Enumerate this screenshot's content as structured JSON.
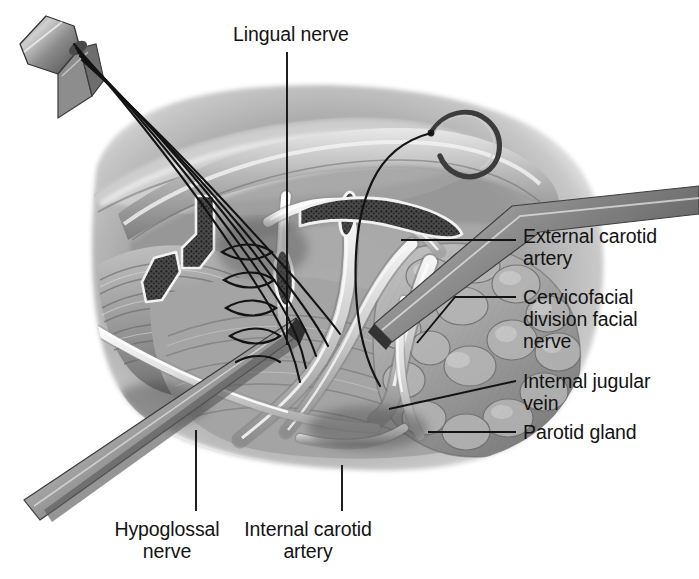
{
  "figure": {
    "kind": "medical-surgical-illustration",
    "style": "grayscale halftone line-and-wash anatomical drawing",
    "background_color": "#ffffff",
    "ink_color": "#131313",
    "tissue_mid_tone": "#9a9a9a",
    "tissue_light_tone": "#d2d2d2",
    "tissue_dark_tone": "#5d5d5d",
    "highlight_tone": "#f2f2f2"
  },
  "labels": [
    {
      "id": "lingual",
      "text": "Lingual nerve",
      "align": "left"
    },
    {
      "id": "external",
      "text": "External carotid\nartery",
      "align": "left"
    },
    {
      "id": "cervico",
      "text": "Cervicofacial\ndivision facial\nnerve",
      "align": "left"
    },
    {
      "id": "jugular",
      "text": "Internal jugular\nvein",
      "align": "left"
    },
    {
      "id": "parotid",
      "text": "Parotid gland",
      "align": "left"
    },
    {
      "id": "hypo",
      "text": "Hypoglossal\nnerve",
      "align": "center"
    },
    {
      "id": "ica",
      "text": "Internal carotid\nartery",
      "align": "center"
    }
  ],
  "leader_lines": [
    {
      "for": "lingual",
      "path": "M287,52 L287,345"
    },
    {
      "for": "external",
      "path": "M401,240 L516,240"
    },
    {
      "for": "cervico",
      "path": "M417,343 L455,297 L516,297"
    },
    {
      "for": "jugular",
      "path": "M389,409 L516,381"
    },
    {
      "for": "parotid",
      "path": "M428,432 L516,432"
    },
    {
      "for": "hypo",
      "path": "M196,430 L196,511"
    },
    {
      "for": "ica",
      "path": "M342,465 L342,511"
    }
  ],
  "instruments": [
    {
      "name": "hemostat-clamp",
      "note": "tissue clamp at upper left gripping five suture strands"
    },
    {
      "name": "suture-strands",
      "count": 5,
      "note": "long dark sutures running from clamp down to anastomosis site"
    },
    {
      "name": "curved-needle",
      "note": "curved surgical needle with attached suture, upper right"
    },
    {
      "name": "retractor-blade-lower",
      "note": "flat retractor crossing lower left over hypoglossal nerve"
    },
    {
      "name": "retractor-blade-upper",
      "note": "flat retractor entering from right over parotid region"
    },
    {
      "name": "vessel-loops",
      "count": 3,
      "note": "dark textured loops encircling vessels/nerves"
    }
  ],
  "anastomosis": {
    "name": "nerve-anastomosis-sutures",
    "stitch_count": 5,
    "note": "interrupted epineural stitches at the nerve coaptation site"
  }
}
